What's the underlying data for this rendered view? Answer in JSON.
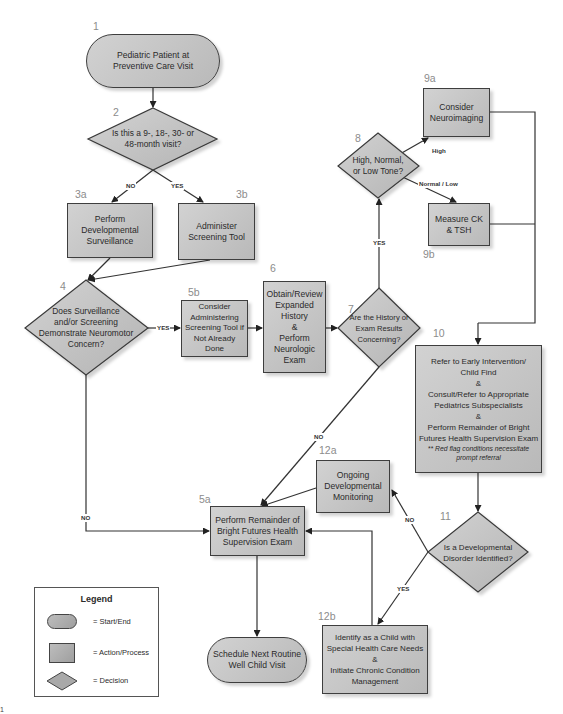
{
  "diagram": {
    "nodes": [
      {
        "id": "1",
        "number": "1",
        "type": "start_end",
        "label": "Pediatric Patient at\nPreventive Care Visit"
      },
      {
        "id": "2",
        "number": "2",
        "type": "decision",
        "label": "Is this a 9-, 18-, 30- or\n48-month visit?"
      },
      {
        "id": "3a",
        "number": "3a",
        "type": "action",
        "label": "Perform\nDevelopmental\nSurveillance"
      },
      {
        "id": "3b",
        "number": "3b",
        "type": "action",
        "label": "Administer\nScreening Tool"
      },
      {
        "id": "4",
        "number": "4",
        "type": "decision",
        "label": "Does Surveillance\nand/or Screening\nDemonstrate Neuromotor\nConcern?"
      },
      {
        "id": "5b",
        "number": "5b",
        "type": "action",
        "label": "Consider\nAdministering\nScreening Tool if\nNot Already\nDone"
      },
      {
        "id": "6",
        "number": "6",
        "type": "action",
        "label": "Obtain/Review\nExpanded\nHistory\n&\nPerform\nNeurologic\nExam"
      },
      {
        "id": "7",
        "number": "7",
        "type": "decision",
        "label": "Are the History or\nExam Results\nConcerning?"
      },
      {
        "id": "8",
        "number": "8",
        "type": "decision",
        "label": "High, Normal,\nor Low Tone?"
      },
      {
        "id": "9a",
        "number": "9a",
        "type": "action",
        "label": "Consider\nNeuroimaging"
      },
      {
        "id": "9b",
        "number": "9b",
        "type": "action",
        "label": "Measure CK\n& TSH"
      },
      {
        "id": "10",
        "number": "10",
        "type": "action",
        "label": "Refer to Early Intervention/\nChild Find\n&\nConsult/Refer to Appropriate\nPediatrics Subspecialists\n&\nPerform Remainder of Bright\nFutures Health Supervision Exam",
        "note": "** Red flag conditions necessitate\nprompt referral"
      },
      {
        "id": "11",
        "number": "11",
        "type": "decision",
        "label": "Is a Developmental\nDisorder Identified?"
      },
      {
        "id": "12a",
        "number": "12a",
        "type": "action",
        "label": "Ongoing\nDevelopmental\nMonitoring"
      },
      {
        "id": "5a",
        "number": "5a",
        "type": "action",
        "label": "Perform Remainder of\nBright Futures Health\nSupervision Exam"
      },
      {
        "id": "12b",
        "number": "12b",
        "type": "action",
        "label": "Identify as a Child with\nSpecial Health Care Needs\n&\nInitiate Chronic Condition\nManagement"
      },
      {
        "id": "end",
        "number": "",
        "type": "start_end",
        "label": "Schedule Next Routine\nWell Child Visit"
      }
    ],
    "edges": [
      {
        "from": "1",
        "to": "2",
        "label": ""
      },
      {
        "from": "2",
        "to": "3a",
        "label": "NO"
      },
      {
        "from": "2",
        "to": "3b",
        "label": "YES"
      },
      {
        "from": "3a",
        "to": "4",
        "label": ""
      },
      {
        "from": "3b",
        "to": "4",
        "label": ""
      },
      {
        "from": "4",
        "to": "5b",
        "label": "YES"
      },
      {
        "from": "4",
        "to": "5a",
        "label": "NO"
      },
      {
        "from": "5b",
        "to": "6",
        "label": ""
      },
      {
        "from": "6",
        "to": "7",
        "label": ""
      },
      {
        "from": "7",
        "to": "8",
        "label": "YES"
      },
      {
        "from": "7",
        "to": "5a",
        "label": "NO"
      },
      {
        "from": "8",
        "to": "9a",
        "label": "High"
      },
      {
        "from": "8",
        "to": "9b",
        "label": "Normal / Low"
      },
      {
        "from": "9a",
        "to": "10",
        "label": ""
      },
      {
        "from": "9b",
        "to": "10",
        "label": ""
      },
      {
        "from": "10",
        "to": "11",
        "label": ""
      },
      {
        "from": "11",
        "to": "12a",
        "label": "NO"
      },
      {
        "from": "11",
        "to": "12b",
        "label": "YES"
      },
      {
        "from": "12a",
        "to": "5a",
        "label": ""
      },
      {
        "from": "12b",
        "to": "5a",
        "label": ""
      },
      {
        "from": "5a",
        "to": "end",
        "label": ""
      }
    ]
  },
  "edge_labels": {
    "no_2": "NO",
    "yes_2": "YES",
    "yes_4": "YES",
    "no_4": "NO",
    "yes_7": "YES",
    "no_7": "NO",
    "high_8": "High",
    "normlow_8": "Normal / Low",
    "no_11": "NO",
    "yes_11": "YES"
  },
  "legend": {
    "title": "Legend",
    "items": [
      {
        "shape": "start_end",
        "label": "= Start/End"
      },
      {
        "shape": "action",
        "label": "= Action/Process"
      },
      {
        "shape": "decision",
        "label": "= Decision"
      }
    ]
  },
  "corner_mark": "1"
}
